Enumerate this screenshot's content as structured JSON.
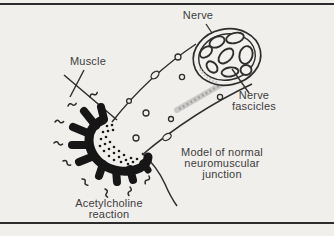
{
  "figure": {
    "title_context": "Model of normal neuromuscular junction",
    "labels": {
      "nerve": "Nerve",
      "muscle": "Muscle",
      "fascicles_line1": "Nerve",
      "fascicles_line2": "fascicles",
      "caption_line1": "Model of normal",
      "caption_line2": "neuromuscular",
      "caption_line3": "junction",
      "acetylcholine_line1": "Acetylcholine",
      "acetylcholine_line2": "reaction"
    },
    "colors": {
      "background": "#f1efec",
      "ink": "#2e2e2e",
      "text": "#3d3d3d",
      "terminal_black": "#161616",
      "shading_gray": "#b5b5b5"
    }
  }
}
